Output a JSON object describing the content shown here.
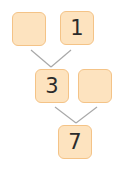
{
  "diagram": {
    "type": "number-pyramid",
    "colors": {
      "node_fill": "#fde3bf",
      "node_border": "#f4c387",
      "text": "#2b2b2b",
      "link": "#a8a8a8"
    },
    "nodes": [
      {
        "id": "top-left",
        "value": ""
      },
      {
        "id": "top-right",
        "value": "1"
      },
      {
        "id": "middle-left",
        "value": "3"
      },
      {
        "id": "middle-right",
        "value": ""
      },
      {
        "id": "bottom",
        "value": "7"
      }
    ],
    "links": [
      {
        "from": "top-left",
        "to": "middle-left"
      },
      {
        "from": "top-right",
        "to": "middle-left"
      },
      {
        "from": "middle-left",
        "to": "bottom"
      },
      {
        "from": "middle-right",
        "to": "bottom"
      }
    ]
  }
}
